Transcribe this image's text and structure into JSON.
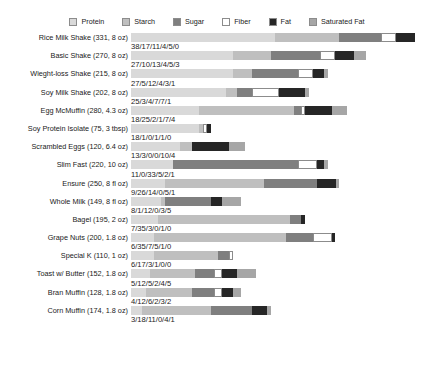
{
  "chart_data": {
    "type": "bar",
    "orientation": "horizontal",
    "stacked": true,
    "title": "",
    "subtitle": "",
    "xlabel": "",
    "ylabel": "",
    "grid": false,
    "legend_position": "top",
    "xlim": [
      0,
      80
    ],
    "unit": "grams",
    "legend": [
      "Protein",
      "Starch",
      "Sugar",
      "Fiber",
      "Fat",
      "Saturated Fat"
    ],
    "series_colors": {
      "Protein": "#d9d9d9",
      "Starch": "#bfbfbf",
      "Sugar": "#7f7f7f",
      "Fiber": "#ffffff",
      "Fat": "#262626",
      "Saturated Fat": "#a6a6a6"
    },
    "categories": [
      "Rice Milk Shake (331, 8 oz)",
      "Basic Shake (270, 8 oz)",
      "Wieght-loss Shake (215, 8 oz)",
      "Soy Milk Shake (202, 8 oz)",
      "Egg McMuffin (280, 4.3 oz)",
      "Soy Protein Isolate (75, 3 tbsp)",
      "Scrambled Eggs (120, 6.4 oz)",
      "Slim Fast (220, 10 oz)",
      "Ensure (250, 8 fl oz)",
      "Whole Milk (149, 8 fl oz)",
      "Bagel (195, 2 oz)",
      "Grape Nuts (200, 1.8 oz)",
      "Special K (110, 1 oz)",
      "Toast w/ Butter (152, 1.8 oz)",
      "Bran Muffin (128, 1.8 oz)",
      "Corn Muffin (174, 1.8 oz)"
    ],
    "series": [
      {
        "name": "Protein",
        "values": [
          38,
          27,
          27,
          25,
          18,
          18,
          13,
          11,
          9,
          8,
          7,
          6,
          6,
          5,
          4,
          3
        ]
      },
      {
        "name": "Starch",
        "values": [
          17,
          10,
          5,
          3,
          25,
          1,
          3,
          0,
          26,
          1,
          35,
          35,
          17,
          12,
          12,
          18
        ]
      },
      {
        "name": "Sugar",
        "values": [
          11,
          13,
          12,
          4,
          2,
          0,
          0,
          33,
          14,
          12,
          3,
          7,
          3,
          5,
          6,
          11
        ]
      },
      {
        "name": "Fiber",
        "values": [
          4,
          4,
          4,
          7,
          1,
          1,
          0,
          5,
          0,
          0,
          0,
          5,
          1,
          2,
          2,
          0
        ]
      },
      {
        "name": "Fat",
        "values": [
          5,
          5,
          3,
          7,
          7,
          1,
          10,
          2,
          5,
          3,
          1,
          1,
          0,
          4,
          3,
          4
        ]
      },
      {
        "name": "Saturated Fat",
        "values": [
          0,
          3,
          1,
          1,
          4,
          0,
          4,
          1,
          1,
          5,
          0,
          0,
          0,
          5,
          2,
          1
        ]
      }
    ],
    "rows": [
      {
        "label": "Rice Milk Shake (331, 8 oz)",
        "values": "38/17/11/4/5/0",
        "segments": [
          38,
          17,
          11,
          4,
          5,
          0
        ],
        "calories": 331,
        "serving": "8 oz"
      },
      {
        "label": "Basic Shake (270, 8 oz)",
        "values": "27/10/13/4/5/3",
        "segments": [
          27,
          10,
          13,
          4,
          5,
          3
        ],
        "calories": 270,
        "serving": "8 oz"
      },
      {
        "label": "Wieght-loss Shake (215, 8 oz)",
        "values": "27/5/12/4/3/1",
        "segments": [
          27,
          5,
          12,
          4,
          3,
          1
        ],
        "calories": 215,
        "serving": "8 oz"
      },
      {
        "label": "Soy Milk Shake (202, 8 oz)",
        "values": "25/3/4/7/7/1",
        "segments": [
          25,
          3,
          4,
          7,
          7,
          1
        ],
        "calories": 202,
        "serving": "8 oz"
      },
      {
        "label": "Egg McMuffin (280, 4.3 oz)",
        "values": "18/25/2/1/7/4",
        "segments": [
          18,
          25,
          2,
          1,
          7,
          4
        ],
        "calories": 280,
        "serving": "4.3 oz"
      },
      {
        "label": "Soy Protein Isolate (75, 3 tbsp)",
        "values": "18/1/0/1/1/0",
        "segments": [
          18,
          1,
          0,
          1,
          1,
          0
        ],
        "calories": 75,
        "serving": "3 tbsp"
      },
      {
        "label": "Scrambled Eggs (120, 6.4 oz)",
        "values": "13/3/0/0/10/4",
        "segments": [
          13,
          3,
          0,
          0,
          10,
          4
        ],
        "calories": 120,
        "serving": "6.4 oz"
      },
      {
        "label": "Slim Fast (220, 10 oz)",
        "values": "11/0/33/5/2/1",
        "segments": [
          11,
          0,
          33,
          5,
          2,
          1
        ],
        "calories": 220,
        "serving": "10 oz"
      },
      {
        "label": "Ensure (250, 8 fl oz)",
        "values": "9/26/14/0/5/1",
        "segments": [
          9,
          26,
          14,
          0,
          5,
          1
        ],
        "calories": 250,
        "serving": "8 fl oz"
      },
      {
        "label": "Whole Milk (149, 8 fl oz)",
        "values": "8/1/12/0/3/5",
        "segments": [
          8,
          1,
          12,
          0,
          3,
          5
        ],
        "calories": 149,
        "serving": "8 fl oz"
      },
      {
        "label": "Bagel (195, 2 oz)",
        "values": "7/35/3/0/1/0",
        "segments": [
          7,
          35,
          3,
          0,
          1,
          0
        ],
        "calories": 195,
        "serving": "2 oz"
      },
      {
        "label": "Grape Nuts (200, 1.8 oz)",
        "values": "6/35/7/5/1/0",
        "segments": [
          6,
          35,
          7,
          5,
          1,
          0
        ],
        "calories": 200,
        "serving": "1.8 oz"
      },
      {
        "label": "Special K (110, 1 oz)",
        "values": "6/17/3/1/0/0",
        "segments": [
          6,
          17,
          3,
          1,
          0,
          0
        ],
        "calories": 110,
        "serving": "1 oz"
      },
      {
        "label": "Toast w/ Butter (152, 1.8 oz)",
        "values": "5/12/5/2/4/5",
        "segments": [
          5,
          12,
          5,
          2,
          4,
          5
        ],
        "calories": 152,
        "serving": "1.8 oz"
      },
      {
        "label": "Bran Muffin (128, 1.8 oz)",
        "values": "4/12/6/2/3/2",
        "segments": [
          4,
          12,
          6,
          2,
          3,
          2
        ],
        "calories": 128,
        "serving": "1.8 oz"
      },
      {
        "label": "Corn Muffin (174, 1.8 oz)",
        "values": "3/18/11/0/4/1",
        "segments": [
          3,
          18,
          11,
          0,
          4,
          1
        ],
        "calories": 174,
        "serving": "1.8 oz"
      }
    ]
  }
}
